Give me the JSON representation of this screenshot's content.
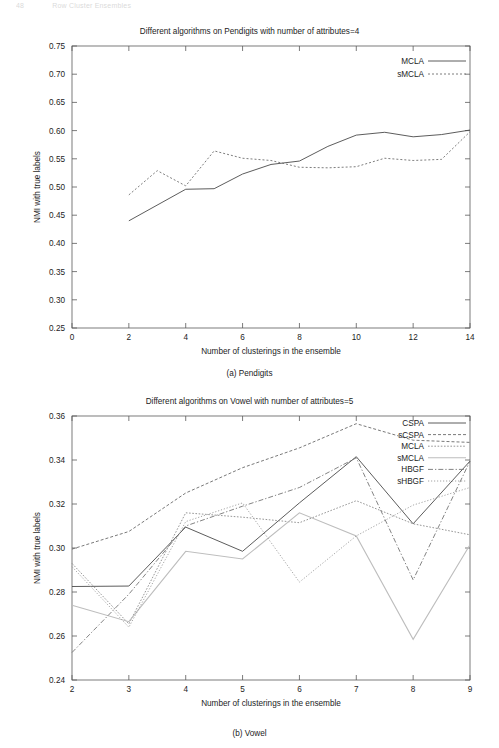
{
  "running_head": {
    "left": "48",
    "right": "Row Cluster Ensembles"
  },
  "figures": [
    {
      "id": "fig-pendigits",
      "caption": "(a) Pendigits",
      "chart_data": {
        "type": "line",
        "title": "Different algorithms on Pendigits with number of attributes=4",
        "xlabel": "Number of clusterings in the ensemble",
        "ylabel": "NMI with true labels",
        "xlim": [
          0,
          14
        ],
        "ylim": [
          0.25,
          0.75
        ],
        "xticks": [
          "0",
          "2",
          "4",
          "6",
          "8",
          "10",
          "12",
          "14"
        ],
        "xtick_values": [
          0,
          2,
          4,
          6,
          8,
          10,
          12,
          14
        ],
        "yticks": [
          "0.25",
          "0.30",
          "0.35",
          "0.40",
          "0.45",
          "0.50",
          "0.55",
          "0.60",
          "0.65",
          "0.70",
          "0.75"
        ],
        "ytick_values": [
          0.25,
          0.3,
          0.35,
          0.4,
          0.45,
          0.5,
          0.55,
          0.6,
          0.65,
          0.7,
          0.75
        ],
        "grid": false,
        "legend_position": "top-right",
        "x": [
          2,
          3,
          4,
          5,
          6,
          7,
          8,
          9,
          10,
          11,
          12,
          13,
          14
        ],
        "series": [
          {
            "name": "MCLA",
            "color": "#4a4a4a",
            "dash": "none",
            "width": 0.9,
            "values": [
              0.44,
              0.461,
              0.478,
              0.496,
              0.497,
              0.523,
              0.54,
              0.546,
              0.557,
              0.572,
              0.577,
              0.586,
              0.592
            ]
          },
          {
            "name": "sMCLA",
            "color": "#6e6e6e",
            "dash": "2,2",
            "width": 0.9,
            "values": [
              0.486,
              0.503,
              0.529,
              0.516,
              0.502,
              0.546,
              0.564,
              0.547,
              0.539,
              0.535,
              0.534,
              0.536,
              0.54
            ]
          }
        ],
        "series_points": {
          "MCLA": [
            [
              2,
              0.44
            ],
            [
              4,
              0.496
            ],
            [
              5,
              0.497
            ],
            [
              6,
              0.523
            ],
            [
              7,
              0.54
            ],
            [
              8,
              0.546
            ],
            [
              9,
              0.572
            ],
            [
              10,
              0.592
            ],
            [
              11,
              0.597
            ],
            [
              12,
              0.589
            ],
            [
              13,
              0.593
            ],
            [
              14,
              0.601
            ]
          ],
          "sMCLA": [
            [
              2,
              0.486
            ],
            [
              3,
              0.529
            ],
            [
              4,
              0.502
            ],
            [
              5,
              0.564
            ],
            [
              6,
              0.551
            ],
            [
              7,
              0.547
            ],
            [
              8,
              0.535
            ],
            [
              9,
              0.534
            ],
            [
              10,
              0.536
            ],
            [
              11,
              0.551
            ],
            [
              12,
              0.547
            ],
            [
              13,
              0.549
            ],
            [
              14,
              0.598
            ]
          ]
        }
      }
    },
    {
      "id": "fig-vowel",
      "caption": "(b) Vowel",
      "chart_data": {
        "type": "line",
        "title": "Different algorithms on Vowel with number of attributes=5",
        "xlabel": "Number of clusterings in the ensemble",
        "ylabel": "NMI with true labels",
        "xlim": [
          2,
          9
        ],
        "ylim": [
          0.24,
          0.36
        ],
        "xticks": [
          "2",
          "3",
          "4",
          "5",
          "6",
          "7",
          "8",
          "9"
        ],
        "xtick_values": [
          2,
          3,
          4,
          5,
          6,
          7,
          8,
          9
        ],
        "yticks": [
          "0.24",
          "0.26",
          "0.28",
          "0.30",
          "0.32",
          "0.34",
          "0.36"
        ],
        "ytick_values": [
          0.24,
          0.26,
          0.28,
          0.3,
          0.32,
          0.34,
          0.36
        ],
        "grid": false,
        "legend_position": "top-right",
        "x": [
          2,
          3,
          4,
          5,
          6,
          7,
          8,
          9
        ],
        "series": [
          {
            "name": "CSPA",
            "color": "#4a4a4a",
            "dash": "none",
            "width": 0.9,
            "values": [
              0.2825,
              0.2827,
              0.3095,
              0.2985,
              0.3205,
              0.3415,
              0.311,
              0.3395
            ]
          },
          {
            "name": "sCSPA",
            "color": "#6a6a6a",
            "dash": "3,2",
            "width": 0.9,
            "values": [
              0.2995,
              0.3075,
              0.325,
              0.3365,
              0.3455,
              0.3565,
              0.349,
              0.348
            ]
          },
          {
            "name": "MCLA",
            "color": "#8a8a8a",
            "dash": "1.6,1.6",
            "width": 0.9,
            "values": [
              0.293,
              0.2655,
              0.316,
              0.314,
              0.3115,
              0.3215,
              0.311,
              0.306
            ]
          },
          {
            "name": "sMCLA",
            "color": "#bdbdbd",
            "dash": "none",
            "width": 1.1,
            "values": [
              0.274,
              0.2665,
              0.2985,
              0.295,
              0.316,
              0.3055,
              0.2585,
              0.3015
            ]
          },
          {
            "name": "HBGF",
            "color": "#757575",
            "dash": "5,2,1.3,2",
            "width": 0.9,
            "values": [
              0.2525,
              0.279,
              0.31,
              0.319,
              0.3275,
              0.341,
              0.2855,
              0.3395
            ]
          },
          {
            "name": "sHBGF",
            "color": "#9a9a9a",
            "dash": "1.2,1.8",
            "width": 0.9,
            "values": [
              0.2915,
              0.264,
              0.312,
              0.3205,
              0.2845,
              0.3055,
              0.3195,
              0.3275
            ]
          }
        ]
      }
    }
  ]
}
